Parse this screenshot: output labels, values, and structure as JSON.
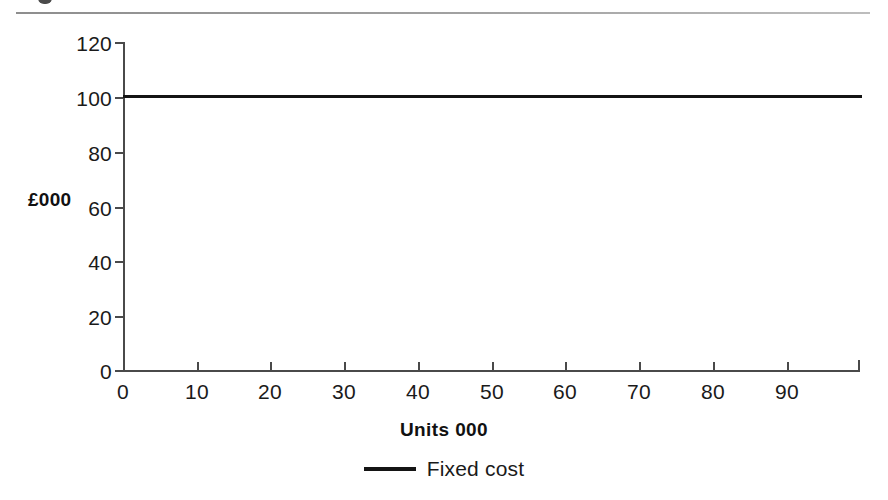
{
  "figure": {
    "background_color": "#ffffff",
    "rule_color": "#9a9a9a",
    "caption_fragment": ""
  },
  "chart_data": {
    "type": "line",
    "title": "",
    "xlabel": "Units 000",
    "ylabel": "£000",
    "xlim": [
      0,
      100
    ],
    "ylim": [
      0,
      120
    ],
    "xticks": [
      0,
      10,
      20,
      30,
      40,
      50,
      60,
      70,
      80,
      90
    ],
    "xtick_labels": [
      "0",
      "10",
      "20",
      "30",
      "40",
      "50",
      "60",
      "70",
      "80",
      "90"
    ],
    "yticks": [
      0,
      20,
      40,
      60,
      80,
      100,
      120
    ],
    "ytick_labels": [
      "0",
      "20",
      "40",
      "60",
      "80",
      "100",
      "120"
    ],
    "grid": false,
    "legend_position": "below",
    "series": [
      {
        "name": "Fixed cost",
        "color": "#141414",
        "linewidth": 3,
        "x": [
          0,
          10,
          20,
          30,
          40,
          50,
          60,
          70,
          80,
          90,
          100
        ],
        "values": [
          100,
          100,
          100,
          100,
          100,
          100,
          100,
          100,
          100,
          100,
          100
        ]
      }
    ],
    "legend": [
      {
        "label": "Fixed cost",
        "marker": "line",
        "color": "#141414"
      }
    ],
    "annotations": []
  }
}
